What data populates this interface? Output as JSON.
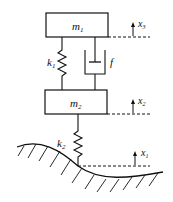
{
  "diagram": {
    "masses": [
      {
        "id": "m1",
        "label": "m",
        "sub": "1"
      },
      {
        "id": "m2",
        "label": "m",
        "sub": "2"
      }
    ],
    "springs": [
      {
        "id": "k1",
        "label": "k",
        "sub": "1"
      },
      {
        "id": "k2",
        "label": "k",
        "sub": "2"
      }
    ],
    "damper": {
      "id": "f",
      "label": "f"
    },
    "displacements": [
      {
        "id": "x3",
        "label": "x",
        "sub": "3"
      },
      {
        "id": "x2",
        "label": "x",
        "sub": "2"
      },
      {
        "id": "x1",
        "label": "x",
        "sub": "1"
      }
    ],
    "colors": {
      "stroke": "#111111",
      "background": "#ffffff"
    }
  }
}
